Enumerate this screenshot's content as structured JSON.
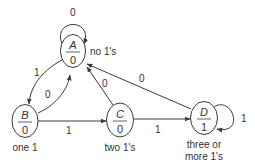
{
  "diagram": {
    "type": "moore-state-machine",
    "colors": {
      "line": "#3a3a3a",
      "text": "#333333",
      "background": "#ffffff"
    },
    "states": [
      {
        "id": "A",
        "name": "A",
        "output": "0",
        "caption": "no 1's"
      },
      {
        "id": "B",
        "name": "B",
        "output": "0",
        "caption": "one 1"
      },
      {
        "id": "C",
        "name": "C",
        "output": "0",
        "caption": "two 1's"
      },
      {
        "id": "D",
        "name": "D",
        "output": "1",
        "caption_line1": "three or",
        "caption_line2": "more 1's"
      }
    ],
    "transitions": [
      {
        "from": "A",
        "to": "A",
        "label": "0"
      },
      {
        "from": "A",
        "to": "B",
        "label": "1"
      },
      {
        "from": "B",
        "to": "A",
        "label": "0"
      },
      {
        "from": "B",
        "to": "C",
        "label": "1"
      },
      {
        "from": "C",
        "to": "A",
        "label": "0"
      },
      {
        "from": "C",
        "to": "D",
        "label": "1"
      },
      {
        "from": "D",
        "to": "A",
        "label": "0"
      },
      {
        "from": "D",
        "to": "D",
        "label": "1"
      }
    ]
  }
}
